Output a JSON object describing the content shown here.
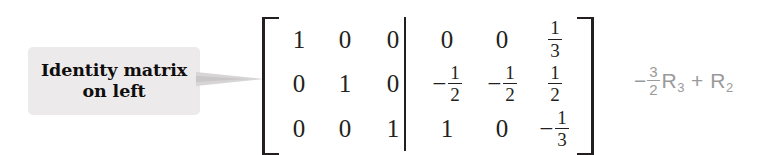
{
  "callout": {
    "line1": "Identity matrix",
    "line2": "on left",
    "box_color": "#eceaea",
    "text_color": "#100d0d",
    "arrow_color": "#d7d5d5"
  },
  "matrix": {
    "bracket_color": "#231f20",
    "rows": [
      {
        "left": [
          "1",
          "0",
          "0"
        ],
        "right": [
          {
            "sign": "",
            "value": "0"
          },
          {
            "sign": "",
            "value": "0"
          },
          {
            "sign": "",
            "num": "1",
            "den": "3"
          }
        ]
      },
      {
        "left": [
          "0",
          "1",
          "0"
        ],
        "right": [
          {
            "sign": "−",
            "num": "1",
            "den": "2"
          },
          {
            "sign": "−",
            "num": "1",
            "den": "2"
          },
          {
            "sign": "",
            "num": "1",
            "den": "2"
          }
        ]
      },
      {
        "left": [
          "0",
          "0",
          "1"
        ],
        "right": [
          {
            "sign": "",
            "value": "1"
          },
          {
            "sign": "",
            "value": "0"
          },
          {
            "sign": "−",
            "num": "1",
            "den": "3"
          }
        ]
      }
    ]
  },
  "row_operation": {
    "sign": "−",
    "coefficient_num": "3",
    "coefficient_den": "2",
    "target_row": "R",
    "target_row_sub": "3",
    "operator": "+",
    "added_row": "R",
    "added_row_sub": "2",
    "color": "#9a9a9a"
  }
}
